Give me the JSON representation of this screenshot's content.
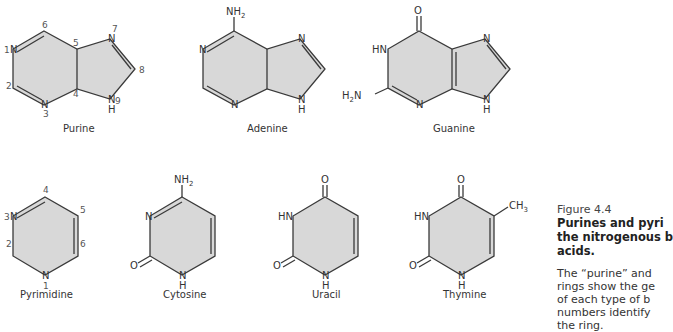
{
  "figure": {
    "number": "Figure 4.4",
    "title_lines": [
      "Purines and pyri",
      "the nitrogenous b",
      "acids."
    ],
    "body_lines": [
      "The “purine” and",
      "rings show the ge",
      "of each type of b",
      "numbers identify",
      "the ring."
    ]
  },
  "molecules": {
    "purine": {
      "caption": "Purine",
      "atoms": {
        "n1": "N",
        "n3": "N",
        "n7": "N",
        "n9": "N",
        "h9": "H"
      },
      "numbers": {
        "p1": "1",
        "p2": "2",
        "p3": "3",
        "p4": "4",
        "p5": "5",
        "p6": "6",
        "p7": "7",
        "p8": "8",
        "p9": "9"
      }
    },
    "adenine": {
      "caption": "Adenine",
      "atoms": {
        "nh2": "NH",
        "nh2_sub": "2",
        "n1": "N",
        "n3": "N",
        "n7": "N",
        "n9": "N",
        "h9": "H"
      }
    },
    "guanine": {
      "caption": "Guanine",
      "atoms": {
        "o": "O",
        "hn": "HN",
        "h2n": "H",
        "h2n_sub": "2",
        "h2n_n": "N",
        "n3": "N",
        "n7": "N",
        "n9": "N",
        "h9": "H"
      }
    },
    "pyrimidine": {
      "caption": "Pyrimidine",
      "atoms": {
        "n3": "N",
        "n1": "N"
      },
      "numbers": {
        "p1": "1",
        "p2": "2",
        "p3": "3",
        "p4": "4",
        "p5": "5",
        "p6": "6"
      }
    },
    "cytosine": {
      "caption": "Cytosine",
      "atoms": {
        "nh2": "NH",
        "nh2_sub": "2",
        "n3": "N",
        "o": "O",
        "n1": "N",
        "h1": "H"
      }
    },
    "uracil": {
      "caption": "Uracil",
      "atoms": {
        "o4": "O",
        "hn": "HN",
        "o2": "O",
        "n1": "N",
        "h1": "H"
      }
    },
    "thymine": {
      "caption": "Thymine",
      "atoms": {
        "o4": "O",
        "hn": "HN",
        "o2": "O",
        "n1": "N",
        "h1": "H",
        "ch3": "CH",
        "ch3_sub": "3"
      }
    }
  }
}
